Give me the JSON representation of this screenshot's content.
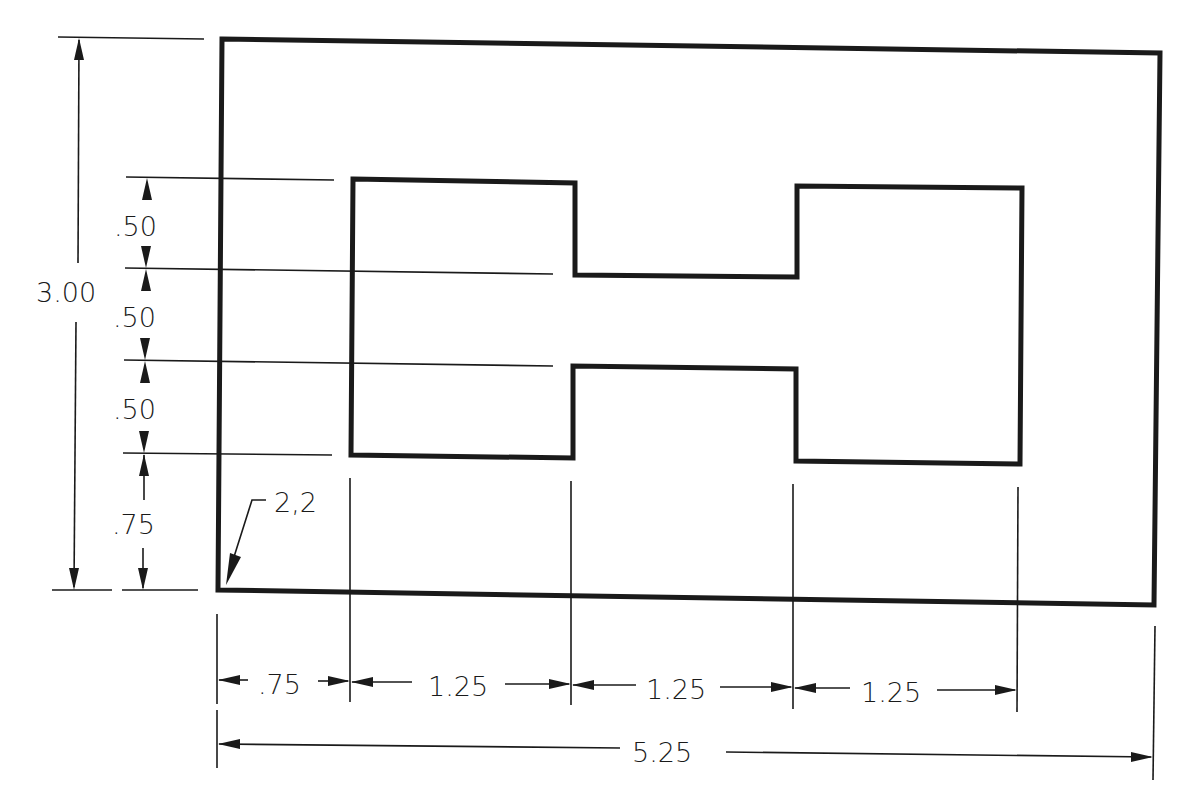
{
  "drawing": {
    "type": "technical-dimensioned-drawing",
    "units": "inches",
    "colors": {
      "ink": "#1a1a1a",
      "paper": "#ffffff"
    },
    "origin_label": "2,2",
    "outer_rectangle": {
      "width": "5.25",
      "height": "3.00"
    },
    "vertical_dimensions": {
      "overall": "3.00",
      "segments": [
        ".50",
        ".50",
        ".50",
        ".75"
      ]
    },
    "horizontal_dimensions": {
      "segments": [
        ".75",
        "1.25",
        "1.25",
        "1.25"
      ],
      "overall": "5.25"
    },
    "inner_shape": "H-shaped cutout: two 1.25 x 1.50 blocks joined by a 1.25 x .50 bridge"
  }
}
